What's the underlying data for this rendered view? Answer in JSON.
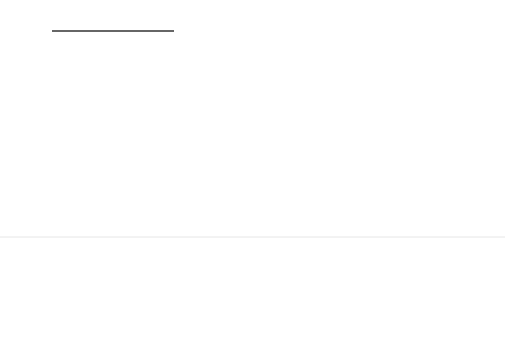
{
  "diagram": {
    "colors": {
      "line": "#333333",
      "port": "#1a1a1a",
      "shadow": "#666666",
      "background": "#ffffff"
    },
    "outer_ports": {
      "top": "acqControl",
      "left": "packetIn",
      "right": "framedOutput"
    },
    "parts": {
      "pipeline_mgr": {
        "name": "PipelineMgr",
        "ports": {
          "top": "acqControl",
          "bottom_left": "pipeline",
          "bottom_right": "stages"
        }
      },
      "framer": {
        "name": "Framer",
        "ports": {
          "top_left_line1": "pipeline",
          "top_left_line2": "Control",
          "top_right": "stageControl",
          "left": "packetIn",
          "right": "imageOut"
        }
      },
      "imager": {
        "name": "Imager",
        "multiplicity": "1..*",
        "ports": {
          "top": "stageControl",
          "left": "imageIn",
          "right_line1": "image",
          "right_line2": "Out"
        }
      }
    },
    "connectors": {
      "event": {
        "name": "Event",
        "end_top": "sender",
        "end_bottom": "receiver"
      },
      "client_server_1": {
        "name": "Client/Server",
        "end_top": "sender",
        "end_bottom": "receiver"
      },
      "client_server_2": {
        "name": "Client/Server",
        "multiplicity": "1..*",
        "end_mult": "*",
        "end_top": "sender",
        "end_bottom": "receiver"
      },
      "image_pipe": {
        "name": "ImagePipe",
        "multiplicity": "1..*",
        "end_left": "source",
        "end_right": "dest",
        "constraint_left": "{or}",
        "constraint_right": "{or}"
      }
    }
  }
}
